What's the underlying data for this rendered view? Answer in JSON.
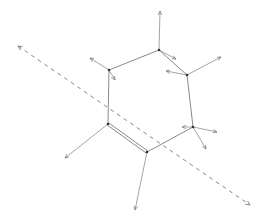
{
  "diagram": {
    "type": "molecular-vibration-mode",
    "colors": {
      "bond": "#8a8a8a",
      "vector": "#9a9a9a",
      "axis": "#8a8a8a",
      "atom": "#333333",
      "background": "#ffffff"
    },
    "atoms": [
      {
        "id": "V1",
        "x": 159,
        "y": 50
      },
      {
        "id": "V2",
        "x": 187,
        "y": 75
      },
      {
        "id": "V3",
        "x": 193,
        "y": 127
      },
      {
        "id": "V4",
        "x": 147,
        "y": 152
      },
      {
        "id": "V5",
        "x": 108,
        "y": 124
      },
      {
        "id": "V6",
        "x": 109,
        "y": 70
      }
    ],
    "bonds": [
      {
        "from": "V1",
        "to": "V2",
        "order": 1
      },
      {
        "from": "V2",
        "to": "V3",
        "order": 1
      },
      {
        "from": "V3",
        "to": "V4",
        "order": 1
      },
      {
        "from": "V4",
        "to": "V5",
        "order": 2
      },
      {
        "from": "V5",
        "to": "V6",
        "order": 1
      },
      {
        "from": "V6",
        "to": "V1",
        "order": 1
      }
    ],
    "vectors": [
      {
        "atom": "V1",
        "x1": 159,
        "y1": 50,
        "x2": 160,
        "y2": 11
      },
      {
        "atom": "V1",
        "x1": 159,
        "y1": 50,
        "x2": 176,
        "y2": 59
      },
      {
        "atom": "V2",
        "x1": 187,
        "y1": 75,
        "x2": 221,
        "y2": 57
      },
      {
        "atom": "V2",
        "x1": 187,
        "y1": 75,
        "x2": 166,
        "y2": 71
      },
      {
        "atom": "V3",
        "x1": 193,
        "y1": 127,
        "x2": 217,
        "y2": 132
      },
      {
        "atom": "V3",
        "x1": 193,
        "y1": 127,
        "x2": 206,
        "y2": 149
      },
      {
        "atom": "V3",
        "x1": 193,
        "y1": 127,
        "x2": 182,
        "y2": 127
      },
      {
        "atom": "V4",
        "x1": 147,
        "y1": 152,
        "x2": 135,
        "y2": 210
      },
      {
        "atom": "V5",
        "x1": 108,
        "y1": 124,
        "x2": 65,
        "y2": 158
      },
      {
        "atom": "V6",
        "x1": 109,
        "y1": 70,
        "x2": 90,
        "y2": 58
      },
      {
        "atom": "V6",
        "x1": 109,
        "y1": 70,
        "x2": 115,
        "y2": 80
      }
    ],
    "axis": {
      "style": "dashed",
      "x1": 18,
      "y1": 46,
      "x2": 250,
      "y2": 205,
      "arrowheads": "both"
    }
  }
}
